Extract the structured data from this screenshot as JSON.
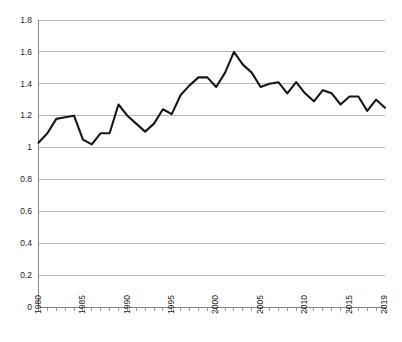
{
  "chart_data": {
    "type": "line",
    "title": "",
    "subtitle": "",
    "xlabel": "",
    "ylabel": "",
    "xlim": [
      1980,
      2019
    ],
    "ylim": [
      0,
      1.8
    ],
    "grid": true,
    "legend": false,
    "legend_position": "none",
    "line_color": "#171717",
    "gridline_color": "#a6a6a6",
    "axis_color": "#808080",
    "background_color": "#ffffff",
    "y_ticks": [
      "0",
      "0.2",
      "0.4",
      "0.6",
      "0.8",
      "1",
      "1.2",
      "1.4",
      "1.6",
      "1.8"
    ],
    "y_tick_values": [
      0,
      0.2,
      0.4,
      0.6,
      0.8,
      1.0,
      1.2,
      1.4,
      1.6,
      1.8
    ],
    "x_tick_labels": [
      "1980",
      "1985",
      "1990",
      "1995",
      "2000",
      "2005",
      "2010",
      "2015",
      "2019"
    ],
    "x_tick_label_values": [
      1980,
      1985,
      1990,
      1995,
      2000,
      2005,
      2010,
      2015,
      2019
    ],
    "x": [
      1980,
      1981,
      1982,
      1983,
      1984,
      1985,
      1986,
      1987,
      1988,
      1989,
      1990,
      1991,
      1992,
      1993,
      1994,
      1995,
      1996,
      1997,
      1998,
      1999,
      2000,
      2001,
      2002,
      2003,
      2004,
      2005,
      2006,
      2007,
      2008,
      2009,
      2010,
      2011,
      2012,
      2013,
      2014,
      2015,
      2016,
      2017,
      2018,
      2019
    ],
    "categories": [
      "1980",
      "1981",
      "1982",
      "1983",
      "1984",
      "1985",
      "1986",
      "1987",
      "1988",
      "1989",
      "1990",
      "1991",
      "1992",
      "1993",
      "1994",
      "1995",
      "1996",
      "1997",
      "1998",
      "1999",
      "2000",
      "2001",
      "2002",
      "2003",
      "2004",
      "2005",
      "2006",
      "2007",
      "2008",
      "2009",
      "2010",
      "2011",
      "2012",
      "2013",
      "2014",
      "2015",
      "2016",
      "2017",
      "2018",
      "2019"
    ],
    "values": [
      1.03,
      1.09,
      1.18,
      1.19,
      1.2,
      1.05,
      1.02,
      1.09,
      1.09,
      1.27,
      1.2,
      1.15,
      1.1,
      1.15,
      1.24,
      1.21,
      1.33,
      1.39,
      1.44,
      1.44,
      1.38,
      1.47,
      1.6,
      1.52,
      1.47,
      1.38,
      1.4,
      1.41,
      1.34,
      1.41,
      1.34,
      1.29,
      1.36,
      1.34,
      1.27,
      1.32,
      1.32,
      1.23,
      1.3,
      1.25
    ],
    "series": [
      {
        "name": "series-1",
        "values": [
          1.03,
          1.09,
          1.18,
          1.19,
          1.2,
          1.05,
          1.02,
          1.09,
          1.09,
          1.27,
          1.2,
          1.15,
          1.1,
          1.15,
          1.24,
          1.21,
          1.33,
          1.39,
          1.44,
          1.44,
          1.38,
          1.47,
          1.6,
          1.52,
          1.47,
          1.38,
          1.4,
          1.41,
          1.34,
          1.41,
          1.34,
          1.29,
          1.36,
          1.34,
          1.27,
          1.32,
          1.32,
          1.23,
          1.3,
          1.25
        ]
      }
    ],
    "annotations": []
  }
}
